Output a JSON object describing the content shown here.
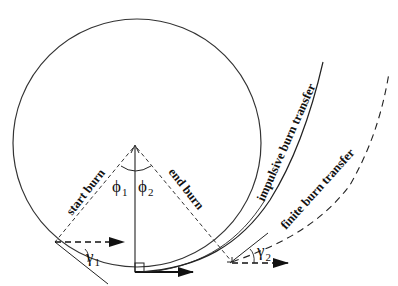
{
  "diagram": {
    "type": "orbital-transfer-geometry",
    "colors": {
      "stroke": "#222222",
      "background": "#ffffff"
    },
    "labels": {
      "start_burn": "start burn",
      "end_burn": "end burn",
      "impulsive": "impulsive burn transfer",
      "finite": "finite burn transfer",
      "phi1": "ϕ",
      "phi1_sub": "1",
      "phi2": "ϕ",
      "phi2_sub": "2",
      "gamma1": "γ",
      "gamma1_sub": "1",
      "gamma2": "γ",
      "gamma2_sub": "2"
    },
    "elements": [
      "initial circular orbit",
      "radial reference line with arrow",
      "right-angle marker at periapsis",
      "velocity arrow at periapsis",
      "dashed radial line to start burn",
      "dashed radial line to end burn",
      "angle arc between phi1 and phi2",
      "impulsive burn transfer trajectory (solid)",
      "finite burn transfer trajectory (dashed)",
      "flight path angle gamma1 at start burn",
      "flight path angle gamma2 at end burn"
    ]
  }
}
